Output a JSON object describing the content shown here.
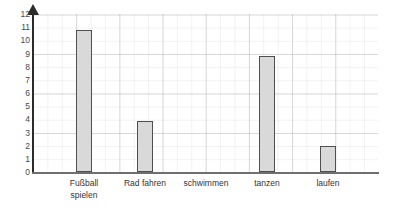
{
  "chart_data": {
    "type": "bar",
    "title": "",
    "subtitle": "",
    "xlabel": "",
    "ylabel": "",
    "categories": [
      "Fußball spielen",
      "Rad fahren",
      "schwimmen",
      "tanzen",
      "laufen"
    ],
    "values": [
      10.8,
      3.9,
      0,
      8.8,
      2
    ],
    "ylim": [
      0,
      12
    ],
    "ytick_labels": [
      "0",
      "1",
      "2",
      "3",
      "4",
      "5",
      "6",
      "7",
      "8",
      "9",
      "10",
      "11",
      "12"
    ],
    "ytick_values": [
      0,
      1,
      2,
      3,
      4,
      5,
      6,
      7,
      8,
      9,
      10,
      11,
      12
    ],
    "grid": true,
    "legend": null,
    "legend_position": "none",
    "annotations": [],
    "colors": {
      "bar_fill": "#d9d9d9",
      "bar_border": "#4f4f4f",
      "axis": "#2b2b2b",
      "baseline": "#6f6f6f",
      "grid_major": "#969ba0",
      "grid_minor": "#c9ced3",
      "tick_text": "#4a4a4a",
      "label_text": "#333333",
      "background": "#ffffff"
    }
  },
  "category_display": [
    "Fußball\nspielen",
    "Rad fahren",
    "schwimmen",
    "tanzen",
    "laufen"
  ]
}
